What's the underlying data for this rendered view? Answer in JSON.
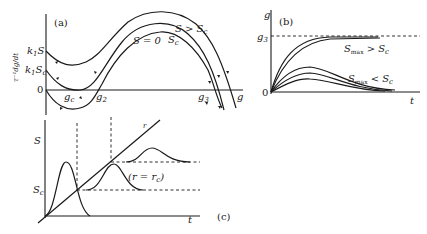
{
  "panels": {
    "a": {
      "label": "(a)",
      "y_axis_label": "τ⁻¹dg/dt",
      "x_axis_label": "g",
      "y_ticks": [
        "k₁S",
        "k₁S_c",
        "0"
      ],
      "x_ticks": [
        "g_c",
        "g₂",
        "g₃"
      ],
      "curve_labels": [
        "S > S_c",
        "S_c",
        "S = 0"
      ]
    },
    "b": {
      "label": "(b)",
      "y_axis_label": "g",
      "x_axis_label": "t",
      "y_ticks": [
        "g₃",
        "0"
      ],
      "curve_labels": [
        "S_max > S_c",
        "S_max < S_c"
      ]
    },
    "c": {
      "label": "(c)",
      "y_axis_label": "S",
      "x_axis_label": "t",
      "y_ticks": [
        "S_c"
      ],
      "line_label": "r",
      "annotation": "(r = r_c)"
    }
  }
}
